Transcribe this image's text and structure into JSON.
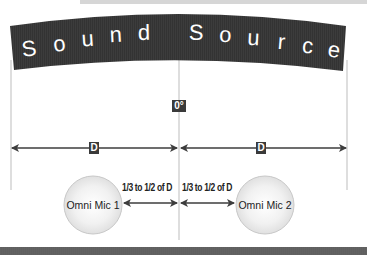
{
  "banner": {
    "title": "Sound Source",
    "letters": [
      "S",
      "o",
      "u",
      "n",
      "d",
      "S",
      "o",
      "u",
      "r",
      "c",
      "e"
    ],
    "color": "#3a3a3a"
  },
  "center_marker": {
    "label": "0°"
  },
  "distance": {
    "left_label": "D",
    "right_label": "D"
  },
  "mics": [
    {
      "label": "Omni Mic 1",
      "spacing_label": "1/3 to 1/2 of D"
    },
    {
      "label": "Omni Mic 2",
      "spacing_label": "1/3 to 1/2 of D"
    }
  ],
  "colors": {
    "banner": "#3a3a3a",
    "lines": "#bdbdbd",
    "arrows": "#3d3d3d",
    "mic_fill_center": "#ffffff",
    "mic_fill_edge": "#e2e2e2"
  }
}
